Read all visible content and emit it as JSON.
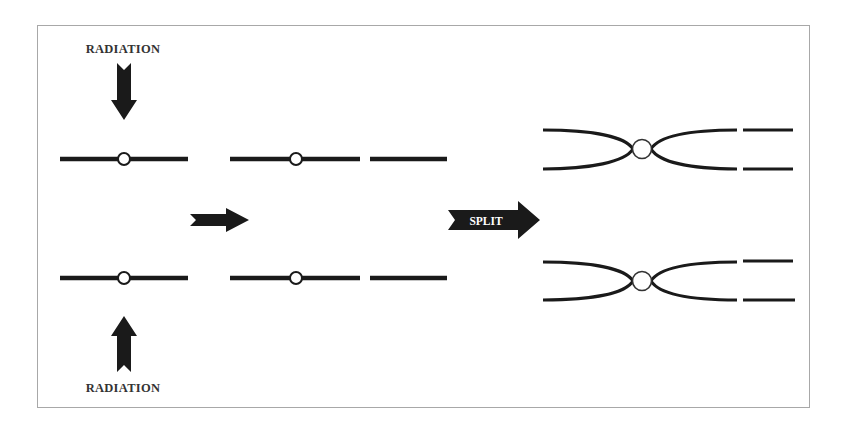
{
  "diagram": {
    "labels": {
      "radiation_top": "RADIATION",
      "radiation_bottom": "RADIATION",
      "split": "SPLIT"
    },
    "stages": [
      {
        "name": "intact-chromosomes",
        "count": 2
      },
      {
        "name": "broken-chromosomes",
        "count": 2
      },
      {
        "name": "replicated-chromatids-with-fragments",
        "count": 2
      }
    ],
    "colors": {
      "ink": "#1a1a1a",
      "frame": "#a8a8a8",
      "label": "#333333",
      "background": "#ffffff"
    }
  }
}
